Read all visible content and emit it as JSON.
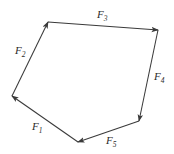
{
  "figure": {
    "background_color": "#ffffff",
    "stroke_color": "#3a3a3a",
    "label_color": "#2b2b2b",
    "width": 174,
    "height": 154
  },
  "vertices": {
    "top_left": {
      "x": 48,
      "y": 22
    },
    "top_right": {
      "x": 158,
      "y": 30
    },
    "bottom_right": {
      "x": 139,
      "y": 121
    },
    "bottom": {
      "x": 78,
      "y": 142
    },
    "left": {
      "x": 12,
      "y": 96
    }
  },
  "vectors": [
    {
      "id": "F1",
      "base": "F",
      "subscript": "1",
      "from": "bottom",
      "to": "left",
      "arrowhead_at": "left",
      "label_x": 32,
      "label_y": 121
    },
    {
      "id": "F2",
      "base": "F",
      "subscript": "2",
      "from": "left",
      "to": "top_left",
      "arrowhead_at": "top_left",
      "label_x": 15,
      "label_y": 45
    },
    {
      "id": "F3",
      "base": "F",
      "subscript": "3",
      "from": "top_left",
      "to": "top_right",
      "arrowhead_at": "top_right",
      "label_x": 97,
      "label_y": 9
    },
    {
      "id": "F4",
      "base": "F",
      "subscript": "4",
      "from": "top_right",
      "to": "bottom_right",
      "arrowhead_at": "bottom_right",
      "label_x": 154,
      "label_y": 71
    },
    {
      "id": "F5",
      "base": "F",
      "subscript": "5",
      "from": "bottom_right",
      "to": "bottom",
      "arrowhead_at": "bottom",
      "label_x": 106,
      "label_y": 135
    }
  ]
}
